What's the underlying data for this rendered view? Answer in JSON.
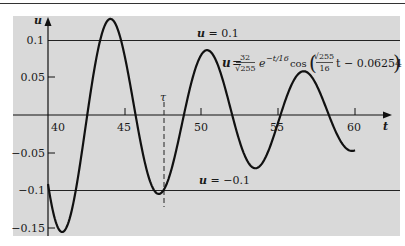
{
  "chart_data": {
    "type": "line",
    "title": "",
    "xlabel": "t",
    "ylabel": "u",
    "xlim": [
      38.5,
      62.5
    ],
    "ylim": [
      -0.16,
      0.13
    ],
    "x_ticks": [
      40,
      45,
      50,
      55,
      60
    ],
    "x_tick_labels": [
      "40",
      "45",
      "50",
      "55",
      "60"
    ],
    "y_ticks": [
      0.1,
      0.05,
      -0.05,
      -0.1,
      -0.15
    ],
    "y_tick_labels": [
      "0.1",
      "0.05",
      "−0.05",
      "−0.1",
      "−0.15"
    ],
    "grid": false,
    "series": [
      {
        "name": "u(t)",
        "formula": "u = 32/sqrt(255) * e^(-t/16) * cos(sqrt(255)/16 * t - 0.06254)",
        "amplitude": 2.00392,
        "decay": 0.0625,
        "omega": 0.998045,
        "phase": 0.06254,
        "t_start": 40,
        "t_end": 60,
        "color": "#111111"
      }
    ],
    "reference_lines": [
      {
        "u": 0.1,
        "label": "u = 0.1"
      },
      {
        "u": -0.1,
        "label": "u = −0.1"
      }
    ],
    "annotations": [
      {
        "type": "vline-dashed",
        "t": 47.5,
        "label": "τ"
      },
      {
        "type": "equation",
        "text": "u = 32/√255 e^(−t/16) cos(√255/16 t − 0.06254)"
      }
    ],
    "key_points": [
      {
        "t": 40,
        "u": -0.092
      },
      {
        "t": 41.1,
        "u": -0.154
      },
      {
        "t": 44.1,
        "u": 0.122
      },
      {
        "t": 47.3,
        "u": -0.101
      },
      {
        "t": 50.4,
        "u": 0.087
      },
      {
        "t": 53.6,
        "u": -0.072
      },
      {
        "t": 56.7,
        "u": 0.059
      },
      {
        "t": 60,
        "u": -0.048
      }
    ]
  },
  "labels": {
    "y_axis": "u",
    "x_axis": "t",
    "tau": "τ",
    "line_upper": "u = 0.1",
    "line_lower": "u = −0.1",
    "eq_u": "u =",
    "eq_num": "32",
    "eq_den": "√255",
    "eq_exp_base": "e",
    "eq_exp": "−t/16",
    "eq_cos": "cos",
    "eq_inner_num": "√255",
    "eq_inner_den": "16",
    "eq_inner_rest": "t − 0.06254"
  }
}
